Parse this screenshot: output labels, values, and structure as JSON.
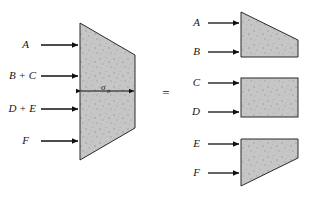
{
  "figure": {
    "equals_sign": "=",
    "stress_symbol": "σ",
    "stress_subscript": "o",
    "fill_color": "#c6c6c6",
    "stroke_color": "#2b2b2b",
    "background_color": "#ffffff"
  },
  "left_body": {
    "name": "combined-trapezoid",
    "loads": [
      {
        "label": "A",
        "y": 45
      },
      {
        "label": "B + C",
        "y": 76
      },
      {
        "label": "D + E",
        "y": 109
      },
      {
        "label": "F",
        "y": 141
      }
    ],
    "dimension": {
      "label_symbol": "σ",
      "label_subscript": "o",
      "y": 91
    }
  },
  "right_bodies": [
    {
      "name": "upper-trapezoid",
      "shape": "trapezoid-top-sloping-down",
      "loads": [
        {
          "label": "A",
          "y": 23
        },
        {
          "label": "B",
          "y": 52
        }
      ]
    },
    {
      "name": "middle-rectangle",
      "shape": "rectangle",
      "loads": [
        {
          "label": "C",
          "y": 83
        },
        {
          "label": "D",
          "y": 112
        }
      ]
    },
    {
      "name": "lower-trapezoid",
      "shape": "trapezoid-bottom-sloping-up",
      "loads": [
        {
          "label": "E",
          "y": 144
        },
        {
          "label": "F",
          "y": 173
        }
      ]
    }
  ]
}
